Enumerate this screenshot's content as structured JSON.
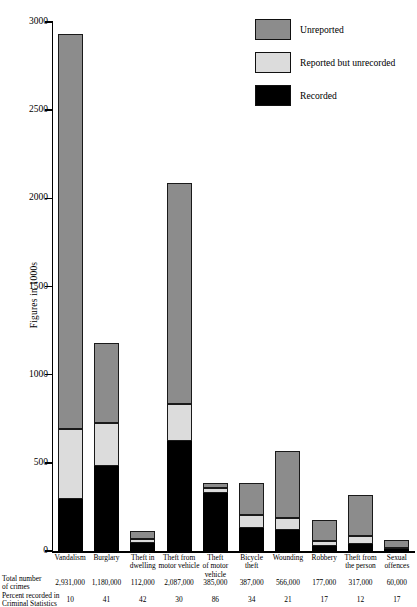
{
  "chart_data": {
    "type": "bar",
    "subtype": "stacked-bar",
    "title": "",
    "xlabel": "",
    "ylabel": "Figures in 1000s",
    "ylim": [
      0,
      3000
    ],
    "yticks": [
      0,
      500,
      1000,
      1500,
      2000,
      2500,
      3000
    ],
    "ytick_labels": [
      "0",
      "500",
      "1000",
      "1500",
      "2000",
      "2500",
      "3000"
    ],
    "grid": false,
    "legend_position": "top-right",
    "units_note": "Values in 1000s of offences",
    "categories": [
      "Vandalism",
      "Burglary",
      "Theft in dwelling",
      "Theft from motor vehicle",
      "Theft of motor vehicle",
      "Bicycle theft",
      "Wounding",
      "Robbery",
      "Theft from the person",
      "Sexual offences"
    ],
    "series": [
      {
        "name": "Recorded",
        "color": "#000000",
        "values": [
          293,
          484,
          47,
          626,
          331,
          132,
          119,
          30,
          38,
          10
        ]
      },
      {
        "name": "Reported but unrecorded",
        "color": "#dcdcdc",
        "values": [
          399,
          241,
          20,
          207,
          26,
          72,
          68,
          25,
          47,
          8
        ]
      },
      {
        "name": "Unreported",
        "color": "#8c8c8c",
        "values": [
          2239,
          455,
          45,
          1254,
          28,
          183,
          379,
          122,
          232,
          42
        ]
      }
    ],
    "totals": [
      2931,
      1180,
      112,
      2087,
      385,
      387,
      566,
      177,
      317,
      60
    ],
    "percent_recorded": [
      10,
      41,
      42,
      30,
      86,
      34,
      21,
      17,
      12,
      17
    ]
  },
  "legend": {
    "items": [
      {
        "label": "Unreported",
        "color": "#8c8c8c"
      },
      {
        "label": "Reported but unrecorded",
        "color": "#dcdcdc"
      },
      {
        "label": "Recorded",
        "color": "#000000"
      }
    ]
  },
  "axis": {
    "y_label": "Figures in 1000s",
    "y_ticks": [
      "3000",
      "2500",
      "2000",
      "1500",
      "1000",
      "500",
      "0"
    ]
  },
  "x_labels": [
    [
      "Vandalism"
    ],
    [
      "Burglary"
    ],
    [
      "Theft in",
      "dwelling"
    ],
    [
      "Theft from",
      "motor vehicle"
    ],
    [
      "Theft",
      "of motor",
      "vehicle"
    ],
    [
      "Bicycle",
      "theft"
    ],
    [
      "Wounding"
    ],
    [
      "Robbery"
    ],
    [
      "Theft from",
      "the person"
    ],
    [
      "Sexual",
      "offences"
    ]
  ],
  "table": {
    "row_total_label_line1": "Total number",
    "row_total_label_line2": "of crimes",
    "row_pct_label_line1": "Percent recorded in",
    "row_pct_label_line2": "Criminal Statistics",
    "totals": [
      "2,931,000",
      "1,180,000",
      "112,000",
      "2,087,000",
      "385,000",
      "387,000",
      "566,000",
      "177,000",
      "317,000",
      "60,000"
    ],
    "percents": [
      "10",
      "41",
      "42",
      "30",
      "86",
      "34",
      "21",
      "17",
      "12",
      "17"
    ]
  }
}
